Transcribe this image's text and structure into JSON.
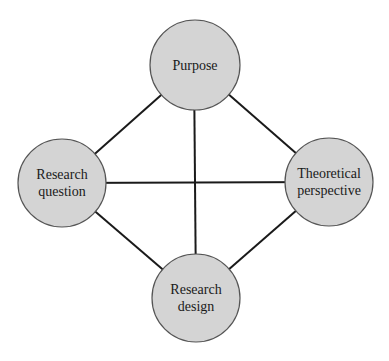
{
  "diagram": {
    "type": "network",
    "colors": {
      "node_fill": "#d4d4d4",
      "node_stroke": "#555555",
      "edge": "#1a1a1a",
      "text": "#1a1a1a"
    },
    "nodes": [
      {
        "id": "purpose",
        "line1": "Purpose",
        "line2": ""
      },
      {
        "id": "question",
        "line1": "Research",
        "line2": "question"
      },
      {
        "id": "theory",
        "line1": "Theoretical",
        "line2": "perspective"
      },
      {
        "id": "design",
        "line1": "Research",
        "line2": "design"
      }
    ],
    "edges": [
      [
        "purpose",
        "question"
      ],
      [
        "purpose",
        "theory"
      ],
      [
        "purpose",
        "design"
      ],
      [
        "question",
        "theory"
      ],
      [
        "question",
        "design"
      ],
      [
        "theory",
        "design"
      ]
    ]
  }
}
